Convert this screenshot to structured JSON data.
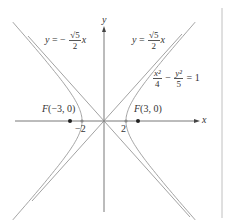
{
  "diagram": {
    "axes": {
      "x_label": "x",
      "y_label": "y"
    },
    "ticks": [
      {
        "label": "−2",
        "value": -2
      },
      {
        "label": "2",
        "value": 2
      }
    ],
    "foci": [
      {
        "label": "F(−3, 0)",
        "x": -3,
        "y": 0
      },
      {
        "label": "F(3, 0)",
        "x": 3,
        "y": 0
      }
    ],
    "asymptotes": [
      {
        "lhs": "y = −",
        "num": "√5",
        "den": "2",
        "var": "x"
      },
      {
        "lhs": "y = ",
        "num": "√5",
        "den": "2",
        "var": "x"
      }
    ],
    "equation": {
      "term1_num": "x²",
      "term1_den": "4",
      "op": "−",
      "term2_num": "y²",
      "term2_den": "5",
      "rhs": "= 1"
    },
    "colors": {
      "axis": "#555555",
      "curve": "#9a9a9a",
      "asymptote": "#8a8a8a",
      "point": "#222222",
      "border": "#bbbbbb"
    }
  }
}
